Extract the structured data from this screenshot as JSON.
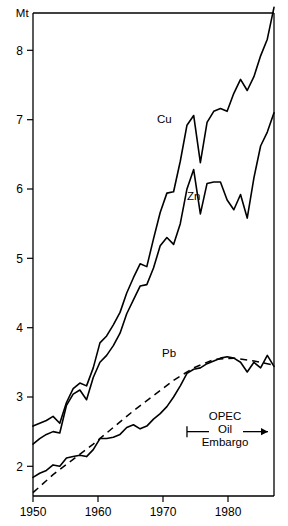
{
  "chart_data": {
    "type": "line",
    "title": "",
    "subtitle": "",
    "xlabel": "",
    "ylabel": "Mt",
    "unit_label": "Mt",
    "xlim": [
      1950,
      1986
    ],
    "ylim": [
      1.55,
      8.85
    ],
    "grid": false,
    "legend_position": "inline-labels",
    "xticks": [
      1950,
      1960,
      1970,
      1980
    ],
    "xtick_labels": [
      "1950",
      "1960",
      "1970",
      "1980"
    ],
    "yticks": [
      2,
      3,
      4,
      5,
      6,
      7,
      8
    ],
    "ytick_labels": [
      "2",
      "3",
      "4",
      "5",
      "6",
      "7",
      "8"
    ],
    "series": [
      {
        "name": "Cu",
        "label": "Cu",
        "style": "solid",
        "color": "#000000",
        "x": [
          1950,
          1951,
          1952,
          1953,
          1954,
          1955,
          1956,
          1957,
          1958,
          1959,
          1960,
          1961,
          1962,
          1963,
          1964,
          1965,
          1966,
          1967,
          1968,
          1969,
          1970,
          1971,
          1972,
          1973,
          1974,
          1975,
          1976,
          1977,
          1978,
          1979,
          1980,
          1981,
          1982,
          1983,
          1984,
          1985,
          1986
        ],
        "values": [
          2.58,
          2.62,
          2.66,
          2.72,
          2.62,
          2.92,
          3.12,
          3.2,
          3.16,
          3.42,
          3.78,
          3.88,
          4.04,
          4.22,
          4.5,
          4.72,
          4.92,
          4.88,
          5.28,
          5.66,
          5.94,
          5.96,
          6.4,
          6.92,
          7.06,
          6.38,
          6.96,
          7.12,
          7.16,
          7.12,
          7.38,
          7.58,
          7.42,
          7.62,
          7.92,
          8.16,
          8.62
        ]
      },
      {
        "name": "Zn",
        "label": "Zn",
        "style": "solid",
        "color": "#000000",
        "x": [
          1950,
          1951,
          1952,
          1953,
          1954,
          1955,
          1956,
          1957,
          1958,
          1959,
          1960,
          1961,
          1962,
          1963,
          1964,
          1965,
          1966,
          1967,
          1968,
          1969,
          1970,
          1971,
          1972,
          1973,
          1974,
          1975,
          1976,
          1977,
          1978,
          1979,
          1980,
          1981,
          1982,
          1983,
          1984,
          1985,
          1986
        ],
        "values": [
          2.32,
          2.4,
          2.46,
          2.5,
          2.48,
          2.88,
          3.04,
          3.1,
          2.96,
          3.28,
          3.5,
          3.6,
          3.74,
          3.92,
          4.2,
          4.4,
          4.6,
          4.62,
          4.86,
          5.18,
          5.3,
          5.2,
          5.5,
          6.0,
          6.28,
          5.64,
          6.08,
          6.1,
          6.1,
          5.84,
          5.7,
          5.92,
          5.58,
          6.16,
          6.62,
          6.82,
          7.1
        ]
      },
      {
        "name": "Pb",
        "label": "Pb",
        "style": "solid",
        "color": "#000000",
        "x": [
          1950,
          1951,
          1952,
          1953,
          1954,
          1955,
          1956,
          1957,
          1958,
          1959,
          1960,
          1961,
          1962,
          1963,
          1964,
          1965,
          1966,
          1967,
          1968,
          1969,
          1970,
          1971,
          1972,
          1973,
          1974,
          1975,
          1976,
          1977,
          1978,
          1979,
          1980,
          1981,
          1982,
          1983,
          1984,
          1985,
          1986
        ],
        "values": [
          1.84,
          1.9,
          1.94,
          2.02,
          2.0,
          2.12,
          2.14,
          2.16,
          2.14,
          2.24,
          2.4,
          2.4,
          2.42,
          2.46,
          2.56,
          2.6,
          2.54,
          2.58,
          2.68,
          2.76,
          2.86,
          3.0,
          3.16,
          3.34,
          3.4,
          3.42,
          3.48,
          3.52,
          3.56,
          3.58,
          3.56,
          3.5,
          3.36,
          3.5,
          3.42,
          3.6,
          3.44
        ]
      },
      {
        "name": "Pb trend",
        "label": "",
        "style": "dashed",
        "color": "#000000",
        "x": [
          1950,
          1953,
          1956,
          1959,
          1962,
          1965,
          1968,
          1971,
          1974,
          1977,
          1980,
          1983,
          1986
        ],
        "values": [
          1.62,
          1.88,
          2.1,
          2.32,
          2.56,
          2.8,
          3.02,
          3.24,
          3.42,
          3.54,
          3.56,
          3.52,
          3.46
        ]
      }
    ],
    "annotations": [
      {
        "name": "opec-oil-embargo",
        "lines": [
          "OPEC",
          "Oil",
          "Embargo"
        ],
        "start_year": 1973,
        "end_year": 1986,
        "value": 2.5,
        "left_cap": "tick",
        "right_cap": "arrow"
      }
    ]
  }
}
